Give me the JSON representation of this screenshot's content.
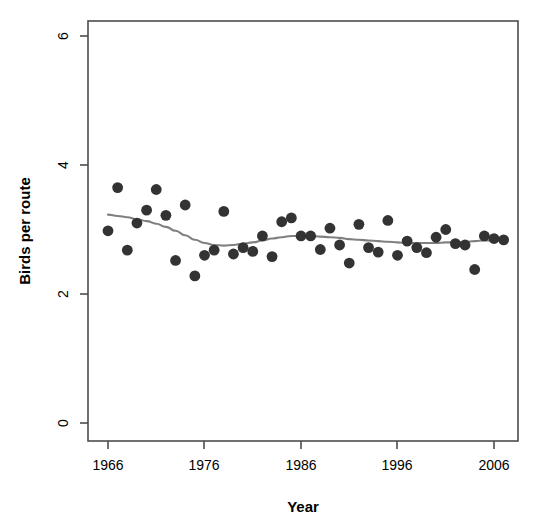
{
  "chart_data": {
    "type": "scatter",
    "title": "",
    "xlabel": "Year",
    "ylabel": "Birds per route",
    "xlim": [
      1965,
      2008
    ],
    "ylim": [
      0,
      6.3
    ],
    "xticks": [
      1966,
      1976,
      1986,
      1996,
      2006
    ],
    "yticks": [
      0,
      2,
      4,
      6
    ],
    "xtick_labels": [
      "1966",
      "1976",
      "1986",
      "1996",
      "2006"
    ],
    "ytick_labels": [
      "0",
      "2",
      "4",
      "6"
    ],
    "grid": false,
    "legend": "none",
    "point_color": "#333333",
    "line_color": "#808080",
    "axis_color": "#4d4d4d",
    "series": [
      {
        "name": "Birds per route",
        "marker": "filled-circle",
        "x": [
          1966,
          1967,
          1968,
          1969,
          1970,
          1971,
          1972,
          1973,
          1974,
          1975,
          1976,
          1977,
          1978,
          1979,
          1980,
          1981,
          1982,
          1983,
          1984,
          1985,
          1986,
          1987,
          1988,
          1989,
          1990,
          1991,
          1992,
          1993,
          1994,
          1995,
          1996,
          1997,
          1998,
          1999,
          2000,
          2001,
          2002,
          2003,
          2004,
          2005,
          2006,
          2007
        ],
        "y": [
          2.98,
          3.65,
          2.68,
          3.1,
          3.3,
          3.62,
          3.22,
          2.52,
          3.38,
          2.28,
          2.6,
          2.68,
          3.28,
          2.62,
          2.72,
          2.66,
          2.9,
          2.58,
          3.12,
          3.18,
          2.9,
          2.9,
          2.69,
          3.02,
          2.76,
          2.48,
          3.08,
          2.72,
          2.65,
          3.14,
          2.6,
          2.82,
          2.72,
          2.64,
          2.88,
          3.0,
          2.78,
          2.76,
          2.38,
          2.9,
          2.86,
          2.84
        ]
      }
    ],
    "smooth": {
      "name": "loess-trend",
      "x": [
        1966,
        1967,
        1968,
        1969,
        1970,
        1971,
        1972,
        1973,
        1974,
        1975,
        1976,
        1977,
        1978,
        1979,
        1980,
        1981,
        1982,
        1983,
        1984,
        1985,
        1986,
        1987,
        1988,
        1989,
        1990,
        1991,
        1992,
        1993,
        1994,
        1995,
        1996,
        1997,
        1998,
        1999,
        2000,
        2001,
        2002,
        2003,
        2004,
        2005,
        2006,
        2007
      ],
      "y": [
        3.23,
        3.21,
        3.19,
        3.16,
        3.13,
        3.09,
        3.04,
        2.98,
        2.91,
        2.84,
        2.79,
        2.76,
        2.75,
        2.76,
        2.78,
        2.8,
        2.83,
        2.86,
        2.88,
        2.9,
        2.9,
        2.9,
        2.89,
        2.88,
        2.87,
        2.85,
        2.84,
        2.83,
        2.82,
        2.81,
        2.8,
        2.79,
        2.79,
        2.79,
        2.79,
        2.8,
        2.8,
        2.81,
        2.82,
        2.83,
        2.83,
        2.83
      ]
    }
  }
}
